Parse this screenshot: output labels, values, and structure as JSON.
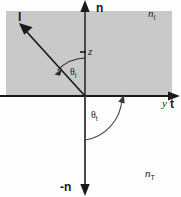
{
  "figure": {
    "background_color": "#fdfdfd",
    "upper_medium_fill": "#c9c9c9",
    "lower_medium_fill": "#fdfdfd",
    "line_color": "#1a1a1a",
    "arc_color": "#3a3a3a"
  },
  "labels": {
    "normal_up": "n",
    "normal_down": "-n",
    "incident_vector": "I",
    "z_axis": "z",
    "y_axis": "y",
    "tangent_vector": "t",
    "theta_incident": "θ",
    "theta_incident_sub": "I",
    "theta_transmitted": "θ",
    "theta_transmitted_sub": "t",
    "index_upper": "n",
    "index_upper_sub": "I",
    "index_lower": "n",
    "index_lower_sub": "T"
  },
  "geometry": {
    "origin_x": 85,
    "origin_y": 96,
    "interface_y": 96,
    "normal_axis_x": 85,
    "incident_ray_tip_x": 21,
    "incident_ray_tip_y": 26,
    "theta_incident_deg": 43,
    "theta_transmitted_deg": 60,
    "upper_region": {
      "x": 6,
      "y": 11,
      "width": 166,
      "height": 85
    }
  }
}
